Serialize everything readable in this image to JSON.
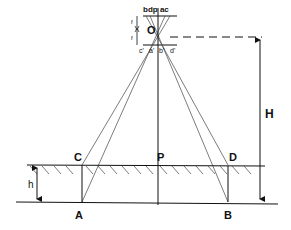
{
  "diagram": {
    "labels": {
      "top_plane": "bdp ac",
      "center": "O",
      "focal_upper": "f",
      "focal_lower": "f",
      "neg_c": "c'",
      "neg_a": "a'",
      "neg_b": "b'",
      "neg_d": "d'",
      "point_c": "C",
      "point_p": "P",
      "point_d": "D",
      "point_a": "A",
      "point_b": "B",
      "flying_height": "H",
      "object_height": "h"
    },
    "colors": {
      "line": "#111111",
      "ray": "#444444",
      "background": "#ffffff"
    }
  }
}
